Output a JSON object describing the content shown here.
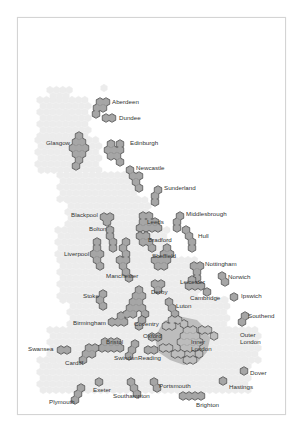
{
  "map": {
    "title": "UK cities hex map",
    "colors": {
      "background_hex": "#ececec",
      "city_fill": "#a6a6a6",
      "city_stroke": "#3a3a3a",
      "london_region": "#bdbdbd",
      "label": "#333333",
      "frame": "#d4d4d4"
    },
    "hex": {
      "w": 6.4,
      "h": 7.4
    },
    "backdrop": [
      [
        50,
        90,
        70,
        100
      ],
      [
        40,
        100,
        90,
        140
      ],
      [
        38,
        140,
        100,
        175
      ],
      [
        60,
        175,
        140,
        200
      ],
      [
        68,
        200,
        150,
        230
      ],
      [
        58,
        230,
        170,
        260
      ],
      [
        60,
        260,
        200,
        300
      ],
      [
        70,
        300,
        230,
        330
      ],
      [
        50,
        330,
        260,
        360
      ],
      [
        40,
        360,
        250,
        395
      ]
    ],
    "backdrop_extras": [
      [
        66,
        113
      ],
      [
        104,
        88
      ],
      [
        63,
        300
      ],
      [
        225,
        300
      ]
    ],
    "london_region": [
      [
        164,
        321
      ],
      [
        178,
        316
      ],
      [
        197,
        320
      ],
      [
        206,
        329
      ],
      [
        210,
        339
      ],
      [
        207,
        352
      ],
      [
        198,
        362
      ],
      [
        184,
        365
      ],
      [
        170,
        360
      ],
      [
        158,
        352
      ],
      [
        155,
        338
      ],
      [
        160,
        328
      ]
    ],
    "cities": [
      {
        "name": "Aberdeen",
        "label": "Aberdeen",
        "lx": 112,
        "ly": 104,
        "hexes": [
          [
            100,
            102
          ],
          [
            106,
            102
          ],
          [
            97,
            108
          ],
          [
            103,
            108
          ],
          [
            96,
            114
          ]
        ]
      },
      {
        "name": "Dundee",
        "label": "Dundee",
        "lx": 119,
        "ly": 120,
        "hexes": [
          [
            106,
            118
          ],
          [
            112,
            118
          ]
        ]
      },
      {
        "name": "Glasgow",
        "label": "Glasgow",
        "lx": 46,
        "ly": 145,
        "hexes": [
          [
            79,
            136
          ],
          [
            76,
            142
          ],
          [
            82,
            142
          ],
          [
            73,
            148
          ],
          [
            79,
            148
          ],
          [
            85,
            148
          ],
          [
            76,
            154
          ],
          [
            82,
            154
          ],
          [
            79,
            160
          ],
          [
            76,
            166
          ]
        ]
      },
      {
        "name": "Edinburgh",
        "label": "Edinburgh",
        "lx": 130,
        "ly": 145,
        "hexes": [
          [
            111,
            144
          ],
          [
            120,
            144
          ],
          [
            108,
            150
          ],
          [
            114,
            150
          ],
          [
            120,
            150
          ],
          [
            111,
            156
          ],
          [
            117,
            156
          ],
          [
            120,
            162
          ]
        ]
      },
      {
        "name": "Newcastle",
        "label": "Newcastle",
        "lx": 136,
        "ly": 170,
        "hexes": [
          [
            130,
            170
          ],
          [
            133,
            176
          ],
          [
            139,
            176
          ],
          [
            136,
            182
          ],
          [
            139,
            188
          ]
        ]
      },
      {
        "name": "Sunderland",
        "label": "Sunderland",
        "lx": 164,
        "ly": 190,
        "hexes": [
          [
            158,
            190
          ],
          [
            155,
            196
          ],
          [
            155,
            202
          ]
        ]
      },
      {
        "name": "Blackpool",
        "label": "Blackpool",
        "lx": 71,
        "ly": 217,
        "hexes": [
          [
            104,
            217
          ],
          [
            110,
            217
          ],
          [
            107,
            222
          ]
        ]
      },
      {
        "name": "Bolton",
        "label": "Bolton",
        "lx": 89,
        "ly": 231,
        "hexes": [
          [
            110,
            230
          ],
          [
            110,
            236
          ],
          [
            113,
            242
          ],
          [
            113,
            248
          ]
        ]
      },
      {
        "name": "Leeds",
        "label": "Leeds",
        "lx": 147,
        "ly": 224,
        "hexes": [
          [
            143,
            216
          ],
          [
            149,
            216
          ],
          [
            143,
            222
          ],
          [
            149,
            222
          ],
          [
            155,
            222
          ],
          [
            140,
            228
          ],
          [
            146,
            228
          ],
          [
            152,
            228
          ],
          [
            158,
            228
          ]
        ]
      },
      {
        "name": "Middlesbrough",
        "label": "Middlesbrough",
        "lx": 186,
        "ly": 216,
        "hexes": [
          [
            180,
            216
          ],
          [
            177,
            222
          ],
          [
            177,
            228
          ]
        ]
      },
      {
        "name": "Bradford",
        "label": "Bradford",
        "lx": 148,
        "ly": 242,
        "hexes": [
          [
            140,
            236
          ],
          [
            146,
            236
          ],
          [
            143,
            242
          ],
          [
            149,
            242
          ],
          [
            152,
            248
          ]
        ]
      },
      {
        "name": "Hull",
        "label": "Hull",
        "lx": 198,
        "ly": 238,
        "hexes": [
          [
            186,
            230
          ],
          [
            189,
            236
          ],
          [
            192,
            242
          ],
          [
            192,
            248
          ]
        ]
      },
      {
        "name": "Liverpool",
        "label": "Liverpool",
        "lx": 64,
        "ly": 256,
        "hexes": [
          [
            97,
            242
          ],
          [
            97,
            248
          ],
          [
            94,
            254
          ],
          [
            100,
            254
          ],
          [
            97,
            260
          ],
          [
            100,
            266
          ]
        ]
      },
      {
        "name": "Manchester",
        "label": "Manchester",
        "lx": 106,
        "ly": 278,
        "hexes": [
          [
            126,
            242
          ],
          [
            123,
            248
          ],
          [
            126,
            254
          ],
          [
            120,
            260
          ],
          [
            126,
            260
          ],
          [
            123,
            266
          ],
          [
            126,
            272
          ],
          [
            129,
            278
          ]
        ]
      },
      {
        "name": "Sheffield",
        "label": "Sheffield",
        "lx": 152,
        "ly": 258,
        "hexes": [
          [
            167,
            248
          ],
          [
            164,
            254
          ],
          [
            170,
            254
          ],
          [
            155,
            260
          ],
          [
            161,
            260
          ],
          [
            167,
            260
          ],
          [
            158,
            266
          ],
          [
            164,
            266
          ]
        ]
      },
      {
        "name": "Nottingham",
        "label": "Nottingham",
        "lx": 205,
        "ly": 266,
        "hexes": [
          [
            194,
            266
          ],
          [
            200,
            266
          ],
          [
            197,
            272
          ],
          [
            197,
            278
          ]
        ]
      },
      {
        "name": "Norwich",
        "label": "Norwich",
        "lx": 228,
        "ly": 279,
        "hexes": [
          [
            222,
            276
          ],
          [
            225,
            282
          ]
        ]
      },
      {
        "name": "Leicester",
        "label": "Leicester",
        "lx": 180,
        "ly": 284,
        "hexes": [
          [
            192,
            280
          ],
          [
            189,
            286
          ],
          [
            195,
            286
          ],
          [
            201,
            286
          ]
        ]
      },
      {
        "name": "Derby",
        "label": "Derby",
        "lx": 151,
        "ly": 294,
        "hexes": [
          [
            155,
            284
          ],
          [
            161,
            284
          ],
          [
            158,
            290
          ]
        ]
      },
      {
        "name": "Cambridge",
        "label": "Cambridge",
        "lx": 190,
        "ly": 300,
        "hexes": [
          [
            207,
            292
          ]
        ]
      },
      {
        "name": "Ipswich",
        "label": "Ipswich",
        "lx": 241,
        "ly": 298,
        "hexes": [
          [
            234,
            297
          ]
        ]
      },
      {
        "name": "Stoke",
        "label": "Stoke",
        "lx": 83,
        "ly": 298,
        "hexes": [
          [
            103,
            294
          ],
          [
            100,
            300
          ],
          [
            103,
            306
          ]
        ]
      },
      {
        "name": "Luton",
        "label": "Luton",
        "lx": 176,
        "ly": 308,
        "hexes": [
          [
            169,
            302
          ],
          [
            172,
            308
          ],
          [
            175,
            314
          ]
        ]
      },
      {
        "name": "Birmingham",
        "label": "Birmingham",
        "lx": 73,
        "ly": 325,
        "hexes": [
          [
            139,
            290
          ],
          [
            136,
            296
          ],
          [
            142,
            296
          ],
          [
            133,
            302
          ],
          [
            139,
            302
          ],
          [
            130,
            308
          ],
          [
            136,
            308
          ],
          [
            127,
            314
          ],
          [
            133,
            314
          ],
          [
            142,
            308
          ],
          [
            145,
            314
          ],
          [
            112,
            322
          ],
          [
            118,
            322
          ],
          [
            124,
            322
          ],
          [
            121,
            316
          ]
        ]
      },
      {
        "name": "Coventry",
        "label": "Coventry",
        "lx": 134,
        "ly": 326,
        "hexes": [
          [
            142,
            320
          ],
          [
            139,
            326
          ]
        ]
      },
      {
        "name": "Southend",
        "label": "Southend",
        "lx": 248,
        "ly": 318,
        "hexes": [
          [
            245,
            316
          ],
          [
            242,
            322
          ]
        ]
      },
      {
        "name": "Oxford",
        "label": "Oxford",
        "lx": 143,
        "ly": 338,
        "hexes": [
          [
            152,
            337
          ],
          [
            158,
            337
          ]
        ]
      },
      {
        "name": "Swansea",
        "label": "Swansea",
        "lx": 28,
        "ly": 351,
        "hexes": [
          [
            61,
            350
          ],
          [
            67,
            350
          ]
        ]
      },
      {
        "name": "Bristol",
        "label": "Bristol",
        "lx": 106,
        "ly": 344,
        "hexes": [
          [
            105,
            342
          ],
          [
            111,
            342
          ],
          [
            117,
            342
          ],
          [
            102,
            348
          ],
          [
            108,
            348
          ],
          [
            114,
            348
          ],
          [
            120,
            348
          ]
        ]
      },
      {
        "name": "Cardiff",
        "label": "Cardiff",
        "lx": 65,
        "ly": 365,
        "hexes": [
          [
            89,
            348
          ],
          [
            95,
            348
          ],
          [
            86,
            354
          ],
          [
            92,
            354
          ],
          [
            83,
            360
          ]
        ]
      },
      {
        "name": "Swindon",
        "label": "Swindon",
        "lx": 114,
        "ly": 360,
        "hexes": [
          [
            135,
            344
          ],
          [
            132,
            350
          ],
          [
            129,
            356
          ]
        ]
      },
      {
        "name": "Reading",
        "label": "Reading",
        "lx": 138,
        "ly": 360,
        "hexes": [
          [
            148,
            350
          ],
          [
            154,
            350
          ]
        ]
      },
      {
        "name": "Inner London",
        "label_lines": [
          "Inner",
          "London"
        ],
        "lx": 191,
        "ly": 344,
        "hexes": [
          [
            187,
            330
          ],
          [
            193,
            330
          ],
          [
            184,
            336
          ],
          [
            190,
            336
          ],
          [
            196,
            336
          ],
          [
            181,
            342
          ],
          [
            187,
            342
          ],
          [
            193,
            342
          ],
          [
            199,
            342
          ],
          [
            184,
            348
          ],
          [
            190,
            348
          ],
          [
            196,
            348
          ]
        ]
      },
      {
        "name": "Outer London",
        "label_lines": [
          "Outer",
          "London"
        ],
        "lx": 240,
        "ly": 337,
        "hexes": [
          [
            172,
            320
          ],
          [
            178,
            320
          ],
          [
            184,
            324
          ],
          [
            166,
            326
          ],
          [
            172,
            326
          ],
          [
            202,
            330
          ],
          [
            208,
            330
          ],
          [
            214,
            336
          ],
          [
            175,
            354
          ],
          [
            181,
            354
          ],
          [
            187,
            360
          ],
          [
            193,
            360
          ],
          [
            199,
            354
          ],
          [
            163,
            348
          ],
          [
            169,
            348
          ]
        ]
      },
      {
        "name": "Dover",
        "label": "Dover",
        "lx": 250,
        "ly": 375,
        "hexes": [
          [
            244,
            371
          ]
        ]
      },
      {
        "name": "Hastings",
        "label": "Hastings",
        "lx": 229,
        "ly": 389,
        "hexes": [
          [
            223,
            381
          ]
        ]
      },
      {
        "name": "Exeter",
        "label": "Exeter",
        "lx": 93,
        "ly": 392,
        "hexes": [
          [
            99,
            382
          ]
        ]
      },
      {
        "name": "Plymouth",
        "label": "Plymouth",
        "lx": 49,
        "ly": 404,
        "hexes": [
          [
            81,
            388
          ],
          [
            78,
            394
          ],
          [
            75,
            400
          ]
        ]
      },
      {
        "name": "Southampton",
        "label": "Southampton",
        "lx": 113,
        "ly": 398,
        "hexes": [
          [
            131,
            382
          ],
          [
            134,
            388
          ],
          [
            137,
            394
          ]
        ]
      },
      {
        "name": "Portsmouth",
        "label": "Portsmouth",
        "lx": 159,
        "ly": 388,
        "hexes": [
          [
            154,
            382
          ],
          [
            157,
            388
          ]
        ]
      },
      {
        "name": "Brighton",
        "label": "Brighton",
        "lx": 196,
        "ly": 407,
        "hexes": [
          [
            183,
            396
          ],
          [
            189,
            396
          ],
          [
            195,
            396
          ],
          [
            201,
            396
          ]
        ]
      }
    ]
  }
}
